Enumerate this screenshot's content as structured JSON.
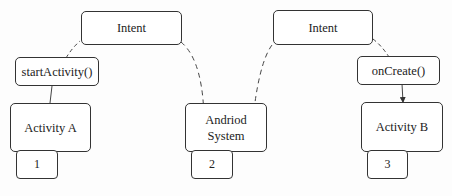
{
  "diagram": {
    "nodes": {
      "intent_left": "Intent",
      "intent_right": "Intent",
      "start_activity": "startActivity()",
      "on_create": "onCreate()",
      "activity_a": "Activity A",
      "android_system_line1": "Andriod",
      "android_system_line2": "System",
      "activity_b": "Activity B"
    },
    "callouts": {
      "one": "1",
      "two": "2",
      "three": "3"
    },
    "edges": [
      {
        "from": "activity_a",
        "to": "start_activity",
        "style": "solid"
      },
      {
        "from": "start_activity",
        "to": "intent_left",
        "style": "dashed"
      },
      {
        "from": "intent_left",
        "to": "android_system",
        "style": "dashed",
        "arrow": true
      },
      {
        "from": "android_system",
        "to": "intent_right",
        "style": "dashed"
      },
      {
        "from": "intent_right",
        "to": "on_create",
        "style": "dashed"
      },
      {
        "from": "on_create",
        "to": "activity_b",
        "style": "solid",
        "arrow": true
      }
    ],
    "colors": {
      "stroke": "#333333",
      "background": "#ffffff"
    }
  }
}
